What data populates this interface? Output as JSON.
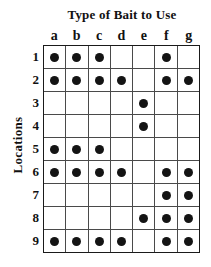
{
  "chart_data": {
    "type": "heatmap",
    "title": "Type of Bait to Use",
    "xlabel": "",
    "ylabel": "Locations",
    "grid": true,
    "legend": "none",
    "categories": [
      "a",
      "b",
      "c",
      "d",
      "e",
      "f",
      "g"
    ],
    "rows": [
      "1",
      "2",
      "3",
      "4",
      "5",
      "6",
      "7",
      "8",
      "9"
    ],
    "notation": "filled dot = bait type used at location; empty cell = not used",
    "marker": "filled-circle",
    "marker_color": "#141414",
    "matrix": [
      [
        1,
        1,
        1,
        0,
        0,
        1,
        0
      ],
      [
        1,
        1,
        1,
        1,
        0,
        1,
        1
      ],
      [
        0,
        0,
        0,
        0,
        1,
        0,
        0
      ],
      [
        0,
        0,
        0,
        0,
        1,
        0,
        0
      ],
      [
        1,
        1,
        1,
        0,
        0,
        0,
        0
      ],
      [
        1,
        1,
        1,
        1,
        0,
        1,
        1
      ],
      [
        0,
        0,
        0,
        0,
        0,
        1,
        1
      ],
      [
        0,
        0,
        0,
        0,
        1,
        1,
        1
      ],
      [
        1,
        1,
        1,
        1,
        0,
        1,
        1
      ]
    ],
    "series": [
      {
        "name": "1",
        "values": [
          1,
          1,
          1,
          0,
          0,
          1,
          0
        ]
      },
      {
        "name": "2",
        "values": [
          1,
          1,
          1,
          1,
          0,
          1,
          1
        ]
      },
      {
        "name": "3",
        "values": [
          0,
          0,
          0,
          0,
          1,
          0,
          0
        ]
      },
      {
        "name": "4",
        "values": [
          0,
          0,
          0,
          0,
          1,
          0,
          0
        ]
      },
      {
        "name": "5",
        "values": [
          1,
          1,
          1,
          0,
          0,
          0,
          0
        ]
      },
      {
        "name": "6",
        "values": [
          1,
          1,
          1,
          1,
          0,
          1,
          1
        ]
      },
      {
        "name": "7",
        "values": [
          0,
          0,
          0,
          0,
          0,
          1,
          1
        ]
      },
      {
        "name": "8",
        "values": [
          0,
          0,
          0,
          0,
          1,
          1,
          1
        ]
      },
      {
        "name": "9",
        "values": [
          1,
          1,
          1,
          1,
          0,
          1,
          1
        ]
      }
    ]
  }
}
